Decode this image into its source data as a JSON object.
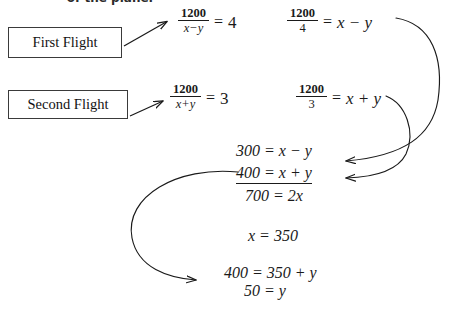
{
  "document": {
    "type": "math-worksheet",
    "topic": "airplane-speed-wind-system-of-equations",
    "header_fragment": "of the plane."
  },
  "boxes": [
    {
      "id": "first-flight",
      "label": "First Flight"
    },
    {
      "id": "second-flight",
      "label": "Second Flight"
    }
  ],
  "equations": {
    "first_flight": {
      "setup": {
        "numerator": "1200",
        "denominator": "x−y",
        "relation": "=",
        "result": "4"
      },
      "rearranged": {
        "numerator": "1200",
        "denominator": "4",
        "relation": "=",
        "result": "x − y"
      }
    },
    "second_flight": {
      "setup": {
        "numerator": "1200",
        "denominator": "x+y",
        "relation": "=",
        "result": "3"
      },
      "rearranged": {
        "numerator": "1200",
        "denominator": "3",
        "relation": "=",
        "result": "x + y"
      }
    }
  },
  "system": {
    "line1": "300 = x − y",
    "line2": "400 = x + y",
    "sum": "700 = 2x"
  },
  "solution": {
    "x_value": "x = 350",
    "substitution": "400 = 350 + y",
    "y_value": "50 = y"
  },
  "arrows": [
    {
      "name": "first-flight-pointer",
      "from": "first-flight box",
      "to": "first equation"
    },
    {
      "name": "second-flight-pointer",
      "from": "second-flight box",
      "to": "second equation"
    },
    {
      "name": "curve-to-300",
      "from": "1200/4 = x - y",
      "to": "300 = x - y"
    },
    {
      "name": "curve-to-400",
      "from": "1200/3 = x + y",
      "to": "400 = x + y"
    },
    {
      "name": "curve-to-substitution",
      "from": "400 = x + y",
      "to": "400 = 350 + y"
    }
  ],
  "colors": {
    "ink": "#1a1a1a",
    "box_border": "#3a3a3a",
    "background": "#ffffff"
  }
}
